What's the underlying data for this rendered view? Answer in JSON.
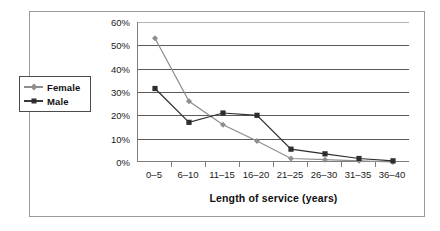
{
  "chart_data": {
    "type": "line",
    "title": "",
    "xlabel": "Length of service (years)",
    "ylabel": "",
    "categories": [
      "0–5",
      "6–10",
      "11–15",
      "16–20",
      "21–25",
      "26–30",
      "31–35",
      "36–40"
    ],
    "ylim": [
      0,
      60
    ],
    "ytick_labels": [
      "0%",
      "10%",
      "20%",
      "30%",
      "40%",
      "50%",
      "60%"
    ],
    "ytick_values": [
      0,
      10,
      20,
      30,
      40,
      50,
      60
    ],
    "grid": true,
    "legend_position": "left-outside",
    "series": [
      {
        "name": "Female",
        "marker": "diamond",
        "color": "#8e8e8e",
        "values": [
          53,
          26,
          16,
          9,
          1.5,
          1,
          0.5,
          0
        ]
      },
      {
        "name": "Male",
        "marker": "square",
        "color": "#2e2e2e",
        "values": [
          31.5,
          17,
          21,
          20,
          5.5,
          3.5,
          1.5,
          0.5
        ]
      }
    ]
  },
  "legend": {
    "items": [
      {
        "label": "Female",
        "marker": "diamond-marker-icon"
      },
      {
        "label": "Male",
        "marker": "square-marker-icon"
      }
    ]
  },
  "colors": {
    "female_series": "#8e8e8e",
    "male_series": "#2e2e2e",
    "gridline": "#5a5a5a",
    "axis": "#7d7d7d",
    "frame": "#9a9a9a",
    "text": "#1a1a1a"
  }
}
